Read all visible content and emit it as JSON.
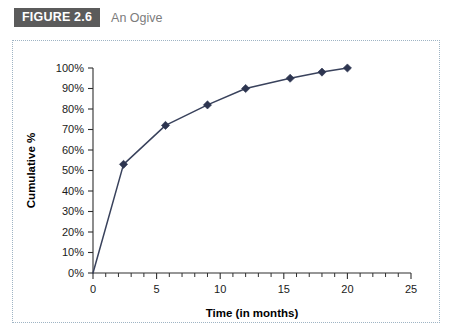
{
  "header": {
    "badge_label": "FIGURE 2.6",
    "caption": "An Ogive",
    "badge_color": "#5b5b5b",
    "caption_color": "#7c7c7c"
  },
  "chart_data": {
    "type": "line",
    "title": "An Ogive",
    "xlabel": "Time (in months)",
    "ylabel": "Cumulative %",
    "xlim": [
      0,
      25
    ],
    "ylim": [
      0,
      100
    ],
    "grid": false,
    "legend": false,
    "line_color": "#39425c",
    "marker_color": "#2d3550",
    "marker_shape": "diamond",
    "x": [
      0,
      2.4,
      5.7,
      9.0,
      12.0,
      15.5,
      18.0,
      20.0
    ],
    "values": [
      0,
      53,
      72,
      82,
      90,
      95,
      98,
      100
    ],
    "x_tick_labels": [
      "0",
      "5",
      "10",
      "15",
      "20",
      "25"
    ],
    "x_tick_values": [
      0,
      5,
      10,
      15,
      20,
      25
    ],
    "x_minor_step": 1,
    "y_tick_labels": [
      "0%",
      "10%",
      "20%",
      "30%",
      "40%",
      "50%",
      "60%",
      "70%",
      "80%",
      "90%",
      "100%"
    ],
    "y_tick_values": [
      0,
      10,
      20,
      30,
      40,
      50,
      60,
      70,
      80,
      90,
      100
    ]
  }
}
